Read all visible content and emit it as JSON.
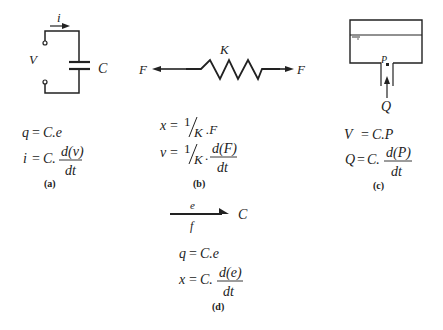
{
  "panels": {
    "a": {
      "caption": "(a)",
      "labels": {
        "current": "i",
        "voltage": "V",
        "capacitor": "C"
      },
      "eq1": {
        "lhs": "q",
        "eq": "=",
        "rhs": "C.e"
      },
      "eq2": {
        "lhs": "i",
        "eq": "=",
        "coef": "C.",
        "num": "d(v)",
        "den": "dt"
      }
    },
    "b": {
      "caption": "(b)",
      "labels": {
        "spring": "K",
        "force_left": "F",
        "force_right": "F"
      },
      "eq1": {
        "lhs": "x",
        "eq": "=",
        "frac_num": "1",
        "frac_den": "K",
        "rhs": ".F"
      },
      "eq2": {
        "lhs": "v",
        "eq": "=",
        "frac_num": "1",
        "frac_den": "K",
        "dot": ".",
        "num": "d(F)",
        "den": "dt"
      }
    },
    "c": {
      "caption": "(c)",
      "labels": {
        "pressure": "P",
        "flow": "Q"
      },
      "eq1": {
        "lhs": "V",
        "eq": "=",
        "rhs": "C.P"
      },
      "eq2": {
        "lhs": "Q",
        "eq": "=",
        "coef": "C.",
        "num": "d(P)",
        "den": "dt"
      }
    },
    "d": {
      "caption": "(d)",
      "labels": {
        "effort": "e",
        "flow": "f",
        "element": "C"
      },
      "eq1": {
        "lhs": "q",
        "eq": "=",
        "rhs": "C.e"
      },
      "eq2": {
        "lhs": "x",
        "eq": "=",
        "coef": "C.",
        "num": "d(e)",
        "den": "dt"
      }
    }
  },
  "colors": {
    "ink": "#222222",
    "background": "#ffffff"
  }
}
